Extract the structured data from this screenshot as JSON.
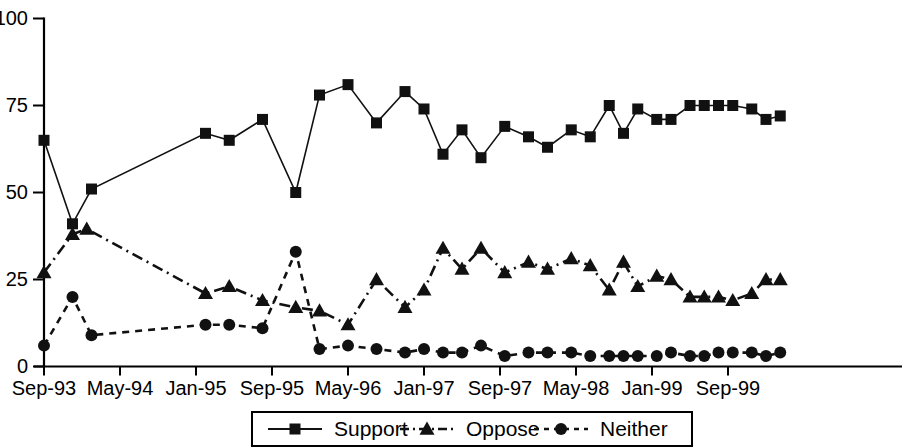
{
  "chart_data": {
    "type": "line",
    "title": "",
    "xlabel": "",
    "ylabel": "",
    "ylim": [
      0,
      100
    ],
    "yticks": [
      0,
      25,
      50,
      75,
      100
    ],
    "ytick_labels": [
      "0",
      "25",
      "50",
      "75",
      "100"
    ],
    "grid": false,
    "legend_position": "bottom-center",
    "x_axis_type": "date",
    "xtick_labels": [
      "Sep-93",
      "May-94",
      "Jan-95",
      "Sep-95",
      "May-96",
      "Jan-97",
      "Sep-97",
      "May-98",
      "Jan-99",
      "Sep-99"
    ],
    "xtick_months": [
      0,
      8,
      16,
      24,
      32,
      40,
      48,
      56,
      64,
      72
    ],
    "x_range_months": [
      0,
      78
    ],
    "series": [
      {
        "name": "Support",
        "marker": "square",
        "line_style": "solid",
        "points": [
          {
            "x": 0,
            "y": 65
          },
          {
            "x": 3,
            "y": 41
          },
          {
            "x": 5,
            "y": 51
          },
          {
            "x": 17,
            "y": 67
          },
          {
            "x": 19.5,
            "y": 65
          },
          {
            "x": 23,
            "y": 71
          },
          {
            "x": 26.5,
            "y": 50
          },
          {
            "x": 29,
            "y": 78
          },
          {
            "x": 32,
            "y": 81
          },
          {
            "x": 35,
            "y": 70
          },
          {
            "x": 38,
            "y": 79
          },
          {
            "x": 40,
            "y": 74
          },
          {
            "x": 42,
            "y": 61
          },
          {
            "x": 44,
            "y": 68
          },
          {
            "x": 46,
            "y": 60
          },
          {
            "x": 48.5,
            "y": 69
          },
          {
            "x": 51,
            "y": 66
          },
          {
            "x": 53,
            "y": 63
          },
          {
            "x": 55.5,
            "y": 68
          },
          {
            "x": 57.5,
            "y": 66
          },
          {
            "x": 59.5,
            "y": 75
          },
          {
            "x": 61,
            "y": 67
          },
          {
            "x": 62.5,
            "y": 74
          },
          {
            "x": 64.5,
            "y": 71
          },
          {
            "x": 66,
            "y": 71
          },
          {
            "x": 68,
            "y": 75
          },
          {
            "x": 69.5,
            "y": 75
          },
          {
            "x": 71,
            "y": 75
          },
          {
            "x": 72.5,
            "y": 75
          },
          {
            "x": 74.5,
            "y": 74
          },
          {
            "x": 76,
            "y": 71
          },
          {
            "x": 77.5,
            "y": 72
          }
        ]
      },
      {
        "name": "Oppose",
        "marker": "triangle",
        "line_style": "dash-dot",
        "points": [
          {
            "x": 0,
            "y": 27
          },
          {
            "x": 3,
            "y": 38
          },
          {
            "x": 4.5,
            "y": 39.5
          },
          {
            "x": 17,
            "y": 21
          },
          {
            "x": 19.5,
            "y": 23
          },
          {
            "x": 23,
            "y": 19
          },
          {
            "x": 26.5,
            "y": 17
          },
          {
            "x": 29,
            "y": 16
          },
          {
            "x": 32,
            "y": 12
          },
          {
            "x": 35,
            "y": 25
          },
          {
            "x": 38,
            "y": 17
          },
          {
            "x": 40,
            "y": 22
          },
          {
            "x": 42,
            "y": 34
          },
          {
            "x": 44,
            "y": 28
          },
          {
            "x": 46,
            "y": 34
          },
          {
            "x": 48.5,
            "y": 27
          },
          {
            "x": 51,
            "y": 30
          },
          {
            "x": 53,
            "y": 28
          },
          {
            "x": 55.5,
            "y": 31
          },
          {
            "x": 57.5,
            "y": 29
          },
          {
            "x": 59.5,
            "y": 22
          },
          {
            "x": 61,
            "y": 30
          },
          {
            "x": 62.5,
            "y": 23
          },
          {
            "x": 64.5,
            "y": 26
          },
          {
            "x": 66,
            "y": 25
          },
          {
            "x": 68,
            "y": 20
          },
          {
            "x": 69.5,
            "y": 20
          },
          {
            "x": 71,
            "y": 20
          },
          {
            "x": 72.5,
            "y": 19
          },
          {
            "x": 74.5,
            "y": 21
          },
          {
            "x": 76,
            "y": 25
          },
          {
            "x": 77.5,
            "y": 25
          }
        ]
      },
      {
        "name": "Neither",
        "marker": "circle",
        "line_style": "dashed",
        "points": [
          {
            "x": 0,
            "y": 6
          },
          {
            "x": 3,
            "y": 20
          },
          {
            "x": 5,
            "y": 9
          },
          {
            "x": 17,
            "y": 12
          },
          {
            "x": 19.5,
            "y": 12
          },
          {
            "x": 23,
            "y": 11
          },
          {
            "x": 26.5,
            "y": 33
          },
          {
            "x": 29,
            "y": 5
          },
          {
            "x": 32,
            "y": 6
          },
          {
            "x": 35,
            "y": 5
          },
          {
            "x": 38,
            "y": 4
          },
          {
            "x": 40,
            "y": 5
          },
          {
            "x": 42,
            "y": 4
          },
          {
            "x": 44,
            "y": 4
          },
          {
            "x": 46,
            "y": 6
          },
          {
            "x": 48.5,
            "y": 3
          },
          {
            "x": 51,
            "y": 4
          },
          {
            "x": 53,
            "y": 4
          },
          {
            "x": 55.5,
            "y": 4
          },
          {
            "x": 57.5,
            "y": 3
          },
          {
            "x": 59.5,
            "y": 3
          },
          {
            "x": 61,
            "y": 3
          },
          {
            "x": 62.5,
            "y": 3
          },
          {
            "x": 64.5,
            "y": 3
          },
          {
            "x": 66,
            "y": 4
          },
          {
            "x": 68,
            "y": 3
          },
          {
            "x": 69.5,
            "y": 3
          },
          {
            "x": 71,
            "y": 4
          },
          {
            "x": 72.5,
            "y": 4
          },
          {
            "x": 74.5,
            "y": 4
          },
          {
            "x": 76,
            "y": 3
          },
          {
            "x": 77.5,
            "y": 4
          }
        ]
      }
    ]
  },
  "legend": {
    "items": [
      {
        "label": "Support",
        "marker": "square",
        "line_style": "solid"
      },
      {
        "label": "Oppose",
        "marker": "triangle",
        "line_style": "dash-dot"
      },
      {
        "label": "Neither",
        "marker": "circle",
        "line_style": "dashed"
      }
    ]
  },
  "colors": {
    "ink": "#111111",
    "axis": "#000000",
    "background": "#ffffff"
  }
}
